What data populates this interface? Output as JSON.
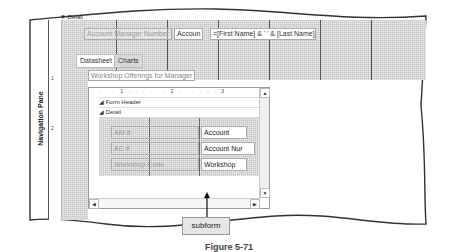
{
  "side_panel": {
    "label": "Navigation Pane"
  },
  "design_view": {
    "section_label": "Detail",
    "labels": {
      "account_manager_number": "Account Manager Number",
      "account_short": "Accoun",
      "name_expression": "=[First Name] & ' ' & [Last Name]"
    },
    "tabs": [
      {
        "label": "Datasheet"
      },
      {
        "label": "Charts"
      }
    ],
    "ruler_marks": [
      "1",
      "2"
    ]
  },
  "subform": {
    "title": "Workshop Offerings for Manager",
    "ruler_text": "· · · 1 · · · · · · 2 · · · · · · 3",
    "sections": {
      "form_header": "Form Header",
      "detail": "Detail"
    },
    "rows": [
      {
        "label": "AM #",
        "field": "Account"
      },
      {
        "label": "AC #",
        "field": "Account Nur"
      },
      {
        "label": "Workshop Code",
        "field": "Workshop"
      }
    ],
    "vruler": [
      "1"
    ]
  },
  "callout": {
    "label": "subform"
  },
  "caption": {
    "text": "Figure 5-71"
  }
}
